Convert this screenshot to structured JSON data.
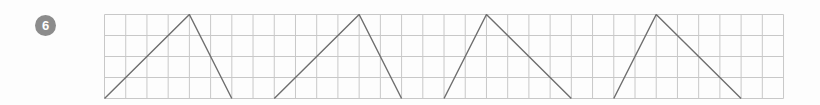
{
  "exercise": {
    "number": "6"
  },
  "grid": {
    "columns": 32,
    "rows": 4,
    "cell_width": 21.22,
    "cell_height": 21,
    "line_color": "#c8c8c8",
    "shape_color": "#6e6e6e"
  },
  "shapes": [
    {
      "name": "triangle-1",
      "points": [
        [
          0,
          4
        ],
        [
          4,
          0
        ],
        [
          6,
          4
        ]
      ]
    },
    {
      "name": "triangle-2",
      "points": [
        [
          8,
          4
        ],
        [
          12,
          0
        ],
        [
          14,
          4
        ]
      ]
    },
    {
      "name": "triangle-3",
      "points": [
        [
          16,
          4
        ],
        [
          18,
          0
        ],
        [
          22,
          4
        ]
      ]
    },
    {
      "name": "triangle-4",
      "points": [
        [
          24,
          4
        ],
        [
          26,
          0
        ],
        [
          30,
          4
        ]
      ]
    }
  ]
}
